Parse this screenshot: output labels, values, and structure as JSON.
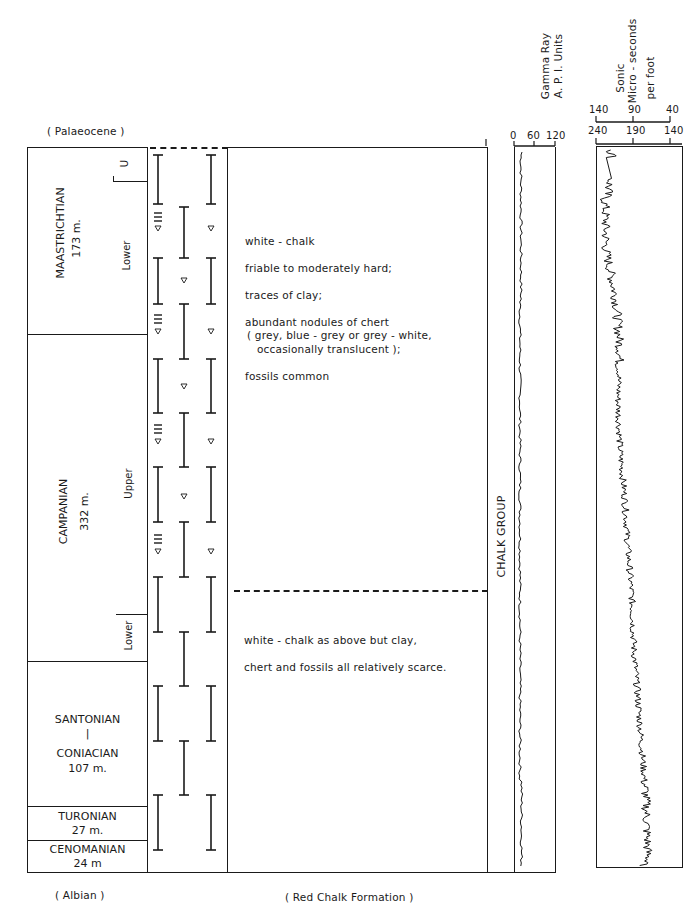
{
  "top_label": "( Palaeocene )",
  "bottom_labels": {
    "left": "( Albian )",
    "center": "( Red Chalk Formation )"
  },
  "stages": [
    {
      "name": "MAASTRICHTIAN",
      "thickness": "173 m.",
      "substages": [
        "U",
        "Lower"
      ]
    },
    {
      "name": "CAMPANIAN",
      "thickness": "332 m.",
      "substages": [
        "Upper",
        "Lower"
      ]
    },
    {
      "name_top": "SANTONIAN",
      "separator": "|",
      "name_bottom": "CONIACIAN",
      "thickness": "107 m."
    },
    {
      "name": "TURONIAN",
      "thickness": "27 m."
    },
    {
      "name": "CENOMANIAN",
      "thickness": "24 m"
    }
  ],
  "description": {
    "upper": [
      "white - chalk",
      "friable to moderately hard;",
      "traces of clay;",
      "abundant nodules of chert",
      "( grey, blue - grey or grey - white,",
      "occasionally translucent );",
      "fossils common"
    ],
    "lower": [
      "white - chalk as above but clay,",
      "chert and fossils all relatively scarce."
    ]
  },
  "group_label": "CHALK GROUP",
  "chart_data": [
    {
      "type": "line",
      "title": "Gamma Ray",
      "xlabel": "A. P. I. Units",
      "x_ticks": [
        "0",
        "60",
        "120"
      ],
      "xlim": [
        0,
        120
      ],
      "y_axis": "depth (top to bottom)",
      "description": "Low, nearly constant gamma ray ~15-25 API through entire chalk section"
    },
    {
      "type": "line",
      "title": "Sonic",
      "xlabel": "Micro - seconds per foot",
      "x_ticks_top": [
        "140",
        "90",
        "40"
      ],
      "x_ticks_bottom": [
        "240",
        "190",
        "140"
      ],
      "xlim": [
        240,
        140
      ],
      "y_axis": "depth (top to bottom)",
      "description": "Sonic transit time ~185-200 at top, trending to ~175-205 spiky mid-section, slower (~190) toward base"
    }
  ],
  "headers": {
    "gamma_title": "Gamma Ray",
    "gamma_units": "A. P. I. Units",
    "gamma_ticks": [
      "0",
      "60",
      "120"
    ],
    "sonic_title": "Sonic",
    "sonic_units1": "Micro - seconds",
    "sonic_units2": "per foot",
    "sonic_ticks_top": [
      "140",
      "90",
      "40"
    ],
    "sonic_ticks_bottom": [
      "240",
      "190",
      "140"
    ]
  }
}
